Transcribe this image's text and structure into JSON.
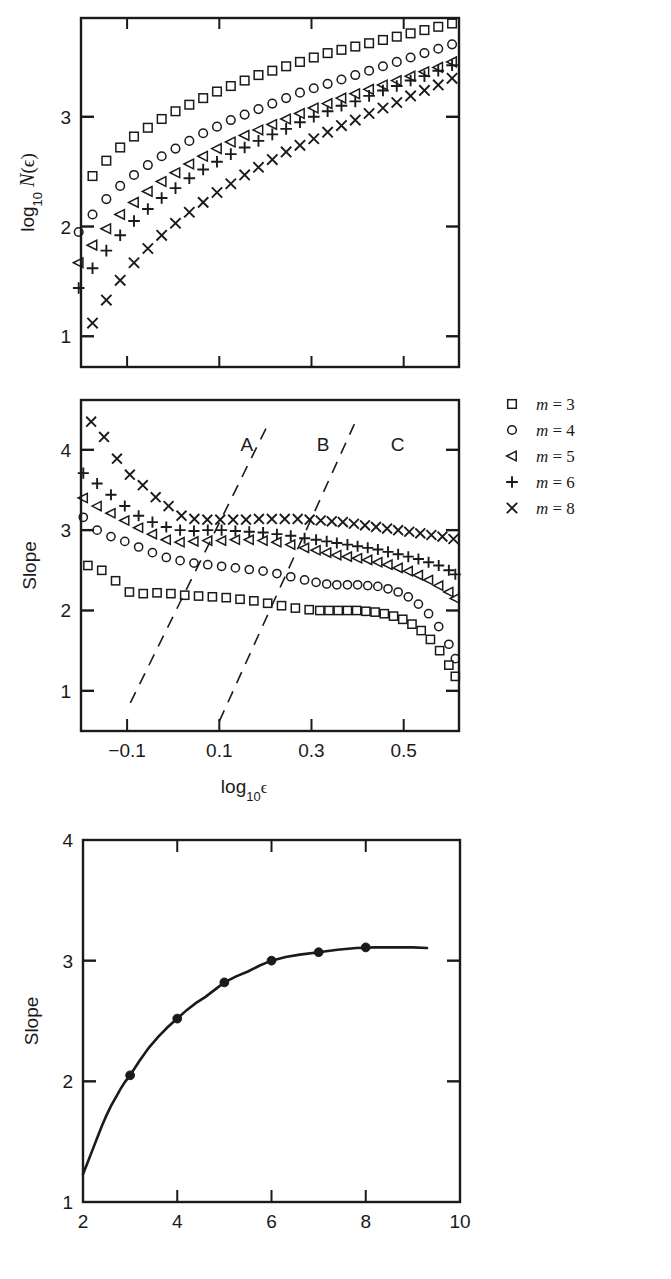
{
  "figure": {
    "background": "#ffffff",
    "ink": "#1a1a1a",
    "panels": [
      "top-box-counting",
      "middle-local-slope",
      "bottom-slope-vs-m"
    ]
  },
  "legend": {
    "name": "series-legend",
    "entries": [
      {
        "marker": "square",
        "label": "m = 3",
        "var": "m",
        "eq": "=",
        "value": "3"
      },
      {
        "marker": "circle",
        "label": "m = 4",
        "var": "m",
        "eq": "=",
        "value": "4"
      },
      {
        "marker": "triangle-left",
        "label": "m = 5",
        "var": "m",
        "eq": "=",
        "value": "5"
      },
      {
        "marker": "plus",
        "label": "m = 6",
        "var": "m",
        "eq": "=",
        "value": "6"
      },
      {
        "marker": "cross",
        "label": "m = 8",
        "var": "m",
        "eq": "=",
        "value": "8"
      }
    ]
  },
  "chart_data": [
    {
      "id": "top",
      "type": "scatter",
      "title": "",
      "xlabel": "log10 e",
      "ylabel": "log10 N(e)",
      "ylabel_parts": {
        "log": "log",
        "sub": "10",
        "N": "N",
        "open": "(",
        "eps": "ϵ",
        "close": ")"
      },
      "xlim": [
        -0.2,
        0.62
      ],
      "ylim": [
        0.72,
        3.9
      ],
      "xticks": [
        -0.1,
        0.1,
        0.3,
        0.5
      ],
      "xticklabels": [
        "−0.1",
        "0.1",
        "0.3",
        "0.5"
      ],
      "yticks": [
        1,
        2,
        3
      ],
      "yticklabels": [
        "1",
        "2",
        "3"
      ],
      "grid": false,
      "legend_position": "outside-right",
      "series": [
        {
          "name": "m = 3",
          "marker": "square",
          "x": [
            -0.175,
            -0.145,
            -0.115,
            -0.085,
            -0.055,
            -0.025,
            0.005,
            0.035,
            0.065,
            0.095,
            0.125,
            0.155,
            0.185,
            0.215,
            0.245,
            0.275,
            0.305,
            0.335,
            0.365,
            0.395,
            0.425,
            0.455,
            0.485,
            0.515,
            0.545,
            0.575,
            0.605
          ],
          "y": [
            2.46,
            2.6,
            2.72,
            2.82,
            2.9,
            2.98,
            3.05,
            3.11,
            3.17,
            3.23,
            3.28,
            3.33,
            3.38,
            3.42,
            3.46,
            3.5,
            3.54,
            3.58,
            3.61,
            3.64,
            3.67,
            3.7,
            3.73,
            3.76,
            3.79,
            3.82,
            3.85
          ]
        },
        {
          "name": "m = 4",
          "marker": "circle",
          "x": [
            -0.205,
            -0.175,
            -0.145,
            -0.115,
            -0.085,
            -0.055,
            -0.025,
            0.005,
            0.035,
            0.065,
            0.095,
            0.125,
            0.155,
            0.185,
            0.215,
            0.245,
            0.275,
            0.305,
            0.335,
            0.365,
            0.395,
            0.425,
            0.455,
            0.485,
            0.515,
            0.545,
            0.575,
            0.605
          ],
          "y": [
            1.95,
            2.11,
            2.25,
            2.37,
            2.47,
            2.56,
            2.64,
            2.71,
            2.78,
            2.85,
            2.91,
            2.97,
            3.02,
            3.07,
            3.12,
            3.17,
            3.22,
            3.26,
            3.3,
            3.34,
            3.38,
            3.42,
            3.46,
            3.5,
            3.54,
            3.58,
            3.62,
            3.66
          ]
        },
        {
          "name": "m = 5",
          "marker": "triangle-left",
          "x": [
            -0.205,
            -0.175,
            -0.145,
            -0.115,
            -0.085,
            -0.055,
            -0.025,
            0.005,
            0.035,
            0.065,
            0.095,
            0.125,
            0.155,
            0.185,
            0.215,
            0.245,
            0.275,
            0.305,
            0.335,
            0.365,
            0.395,
            0.425,
            0.455,
            0.485,
            0.515,
            0.545,
            0.575,
            0.605
          ],
          "y": [
            1.67,
            1.83,
            1.98,
            2.11,
            2.22,
            2.32,
            2.41,
            2.49,
            2.57,
            2.64,
            2.71,
            2.77,
            2.83,
            2.88,
            2.93,
            2.98,
            3.03,
            3.08,
            3.12,
            3.17,
            3.21,
            3.25,
            3.29,
            3.33,
            3.37,
            3.41,
            3.45,
            3.5
          ]
        },
        {
          "name": "m = 6",
          "marker": "plus",
          "x": [
            -0.205,
            -0.175,
            -0.145,
            -0.115,
            -0.085,
            -0.055,
            -0.025,
            0.005,
            0.035,
            0.065,
            0.095,
            0.125,
            0.155,
            0.185,
            0.215,
            0.245,
            0.275,
            0.305,
            0.335,
            0.365,
            0.395,
            0.425,
            0.455,
            0.485,
            0.515,
            0.545,
            0.575,
            0.605
          ],
          "y": [
            1.44,
            1.62,
            1.78,
            1.92,
            2.05,
            2.16,
            2.26,
            2.35,
            2.44,
            2.52,
            2.59,
            2.66,
            2.72,
            2.78,
            2.84,
            2.89,
            2.95,
            3.0,
            3.05,
            3.1,
            3.14,
            3.19,
            3.24,
            3.28,
            3.33,
            3.37,
            3.42,
            3.47
          ]
        },
        {
          "name": "m = 8",
          "marker": "cross",
          "x": [
            -0.175,
            -0.145,
            -0.115,
            -0.085,
            -0.055,
            -0.025,
            0.005,
            0.035,
            0.065,
            0.095,
            0.125,
            0.155,
            0.185,
            0.215,
            0.245,
            0.275,
            0.305,
            0.335,
            0.365,
            0.395,
            0.425,
            0.455,
            0.485,
            0.515,
            0.545,
            0.575,
            0.605
          ],
          "y": [
            1.12,
            1.33,
            1.51,
            1.67,
            1.8,
            1.92,
            2.03,
            2.13,
            2.22,
            2.31,
            2.39,
            2.47,
            2.54,
            2.61,
            2.68,
            2.74,
            2.8,
            2.86,
            2.92,
            2.97,
            3.03,
            3.08,
            3.13,
            3.19,
            3.24,
            3.29,
            3.35
          ]
        }
      ]
    },
    {
      "id": "middle",
      "type": "scatter",
      "title": "",
      "xlabel": "log10 e",
      "ylabel": "Slope",
      "xlim": [
        -0.2,
        0.62
      ],
      "ylim": [
        0.5,
        4.62
      ],
      "xticks": [
        -0.1,
        0.1,
        0.3,
        0.5
      ],
      "xticklabels": [
        "−0.1",
        "0.1",
        "0.3",
        "0.5"
      ],
      "yticks": [
        1,
        2,
        3,
        4
      ],
      "yticklabels": [
        "1",
        "2",
        "3",
        "4"
      ],
      "grid": false,
      "annotations": [
        {
          "text": "A",
          "x": 0.16,
          "y": 4.07
        },
        {
          "text": "B",
          "x": 0.325,
          "y": 4.07
        },
        {
          "text": "C",
          "x": 0.487,
          "y": 4.07
        }
      ],
      "dashed_lines": [
        {
          "x1": -0.093,
          "y1": 0.85,
          "x2": 0.206,
          "y2": 4.32
        },
        {
          "x1": 0.1,
          "y1": 0.62,
          "x2": 0.393,
          "y2": 4.32
        }
      ],
      "series": [
        {
          "name": "m = 3",
          "marker": "square",
          "x": [
            -0.185,
            -0.155,
            -0.125,
            -0.095,
            -0.065,
            -0.035,
            -0.005,
            0.025,
            0.055,
            0.085,
            0.115,
            0.145,
            0.175,
            0.205,
            0.235,
            0.265,
            0.295,
            0.318,
            0.338,
            0.358,
            0.378,
            0.398,
            0.418,
            0.438,
            0.458,
            0.478,
            0.498,
            0.518,
            0.538,
            0.558,
            0.578,
            0.598,
            0.612
          ],
          "y": [
            2.56,
            2.5,
            2.37,
            2.23,
            2.21,
            2.22,
            2.21,
            2.19,
            2.18,
            2.17,
            2.16,
            2.14,
            2.12,
            2.09,
            2.06,
            2.03,
            2.01,
            2.0,
            2.0,
            2.0,
            2.0,
            2.0,
            1.99,
            1.98,
            1.96,
            1.93,
            1.89,
            1.83,
            1.75,
            1.64,
            1.5,
            1.32,
            1.18
          ]
        },
        {
          "name": "m = 4",
          "marker": "circle",
          "x": [
            -0.195,
            -0.165,
            -0.135,
            -0.105,
            -0.075,
            -0.045,
            -0.015,
            0.015,
            0.045,
            0.075,
            0.105,
            0.135,
            0.165,
            0.195,
            0.225,
            0.255,
            0.285,
            0.31,
            0.333,
            0.355,
            0.378,
            0.4,
            0.422,
            0.444,
            0.466,
            0.488,
            0.51,
            0.532,
            0.554,
            0.576,
            0.598,
            0.612
          ],
          "y": [
            3.16,
            3.0,
            2.92,
            2.86,
            2.79,
            2.72,
            2.66,
            2.62,
            2.59,
            2.57,
            2.55,
            2.53,
            2.51,
            2.49,
            2.46,
            2.42,
            2.38,
            2.35,
            2.33,
            2.32,
            2.32,
            2.32,
            2.31,
            2.3,
            2.27,
            2.23,
            2.17,
            2.08,
            1.96,
            1.8,
            1.58,
            1.4
          ]
        },
        {
          "name": "m = 5",
          "marker": "triangle-left",
          "x": [
            -0.195,
            -0.165,
            -0.135,
            -0.105,
            -0.075,
            -0.045,
            -0.015,
            0.015,
            0.045,
            0.075,
            0.105,
            0.135,
            0.165,
            0.195,
            0.225,
            0.255,
            0.285,
            0.31,
            0.333,
            0.355,
            0.378,
            0.4,
            0.422,
            0.444,
            0.466,
            0.488,
            0.51,
            0.532,
            0.554,
            0.576,
            0.598,
            0.612
          ],
          "y": [
            3.4,
            3.3,
            3.21,
            3.12,
            3.03,
            2.95,
            2.88,
            2.85,
            2.86,
            2.87,
            2.87,
            2.88,
            2.88,
            2.87,
            2.85,
            2.82,
            2.78,
            2.75,
            2.72,
            2.69,
            2.67,
            2.65,
            2.63,
            2.6,
            2.57,
            2.53,
            2.49,
            2.44,
            2.38,
            2.31,
            2.23,
            2.15
          ]
        },
        {
          "name": "m = 6",
          "marker": "plus",
          "x": [
            -0.195,
            -0.165,
            -0.135,
            -0.105,
            -0.075,
            -0.045,
            -0.015,
            0.015,
            0.045,
            0.075,
            0.105,
            0.135,
            0.165,
            0.195,
            0.225,
            0.255,
            0.285,
            0.31,
            0.333,
            0.355,
            0.378,
            0.4,
            0.422,
            0.444,
            0.466,
            0.488,
            0.51,
            0.532,
            0.554,
            0.576,
            0.598,
            0.612
          ],
          "y": [
            3.71,
            3.58,
            3.44,
            3.3,
            3.18,
            3.1,
            3.04,
            3.0,
            2.99,
            3.0,
            3.0,
            2.99,
            2.98,
            2.97,
            2.95,
            2.93,
            2.9,
            2.88,
            2.86,
            2.84,
            2.82,
            2.8,
            2.78,
            2.76,
            2.73,
            2.7,
            2.67,
            2.64,
            2.6,
            2.56,
            2.5,
            2.45
          ]
        },
        {
          "name": "m = 8",
          "marker": "cross",
          "x": [
            -0.178,
            -0.15,
            -0.122,
            -0.094,
            -0.066,
            -0.038,
            -0.01,
            0.018,
            0.046,
            0.074,
            0.102,
            0.13,
            0.158,
            0.186,
            0.214,
            0.242,
            0.27,
            0.296,
            0.32,
            0.344,
            0.368,
            0.392,
            0.416,
            0.44,
            0.464,
            0.488,
            0.512,
            0.536,
            0.56,
            0.584,
            0.608
          ],
          "y": [
            4.35,
            4.16,
            3.89,
            3.69,
            3.56,
            3.41,
            3.3,
            3.18,
            3.14,
            3.13,
            3.13,
            3.13,
            3.13,
            3.14,
            3.14,
            3.14,
            3.14,
            3.13,
            3.12,
            3.11,
            3.1,
            3.08,
            3.06,
            3.04,
            3.02,
            3.0,
            2.98,
            2.96,
            2.94,
            2.92,
            2.89
          ]
        }
      ]
    },
    {
      "id": "bottom",
      "type": "line",
      "title": "",
      "xlabel": "m",
      "ylabel": "Slope",
      "xlim": [
        2,
        10
      ],
      "ylim": [
        1,
        4
      ],
      "xticks": [
        2,
        4,
        6,
        8,
        10
      ],
      "xticklabels": [
        "2",
        "4",
        "6",
        "8",
        "10"
      ],
      "yticks": [
        1,
        2,
        3,
        4
      ],
      "yticklabels": [
        "1",
        "2",
        "3",
        "4"
      ],
      "grid": false,
      "markers": {
        "m": [
          3,
          4,
          5,
          6,
          7,
          8
        ],
        "slope": [
          2.05,
          2.52,
          2.82,
          3.0,
          3.07,
          3.11
        ]
      },
      "curve": {
        "x": [
          2.0,
          2.1,
          2.2,
          2.3,
          2.4,
          2.5,
          2.6,
          2.7,
          2.8,
          2.9,
          3.0,
          3.2,
          3.4,
          3.6,
          3.8,
          4.0,
          4.2,
          4.4,
          4.6,
          4.8,
          5.0,
          5.25,
          5.5,
          5.75,
          6.0,
          6.3,
          6.6,
          7.0,
          7.4,
          7.8,
          8.2,
          8.6,
          9.0,
          9.3
        ],
        "y": [
          1.23,
          1.33,
          1.43,
          1.53,
          1.63,
          1.72,
          1.8,
          1.87,
          1.94,
          2.0,
          2.05,
          2.17,
          2.28,
          2.37,
          2.45,
          2.52,
          2.59,
          2.65,
          2.7,
          2.76,
          2.82,
          2.87,
          2.91,
          2.96,
          3.0,
          3.03,
          3.05,
          3.07,
          3.09,
          3.105,
          3.11,
          3.11,
          3.11,
          3.105
        ]
      }
    }
  ]
}
